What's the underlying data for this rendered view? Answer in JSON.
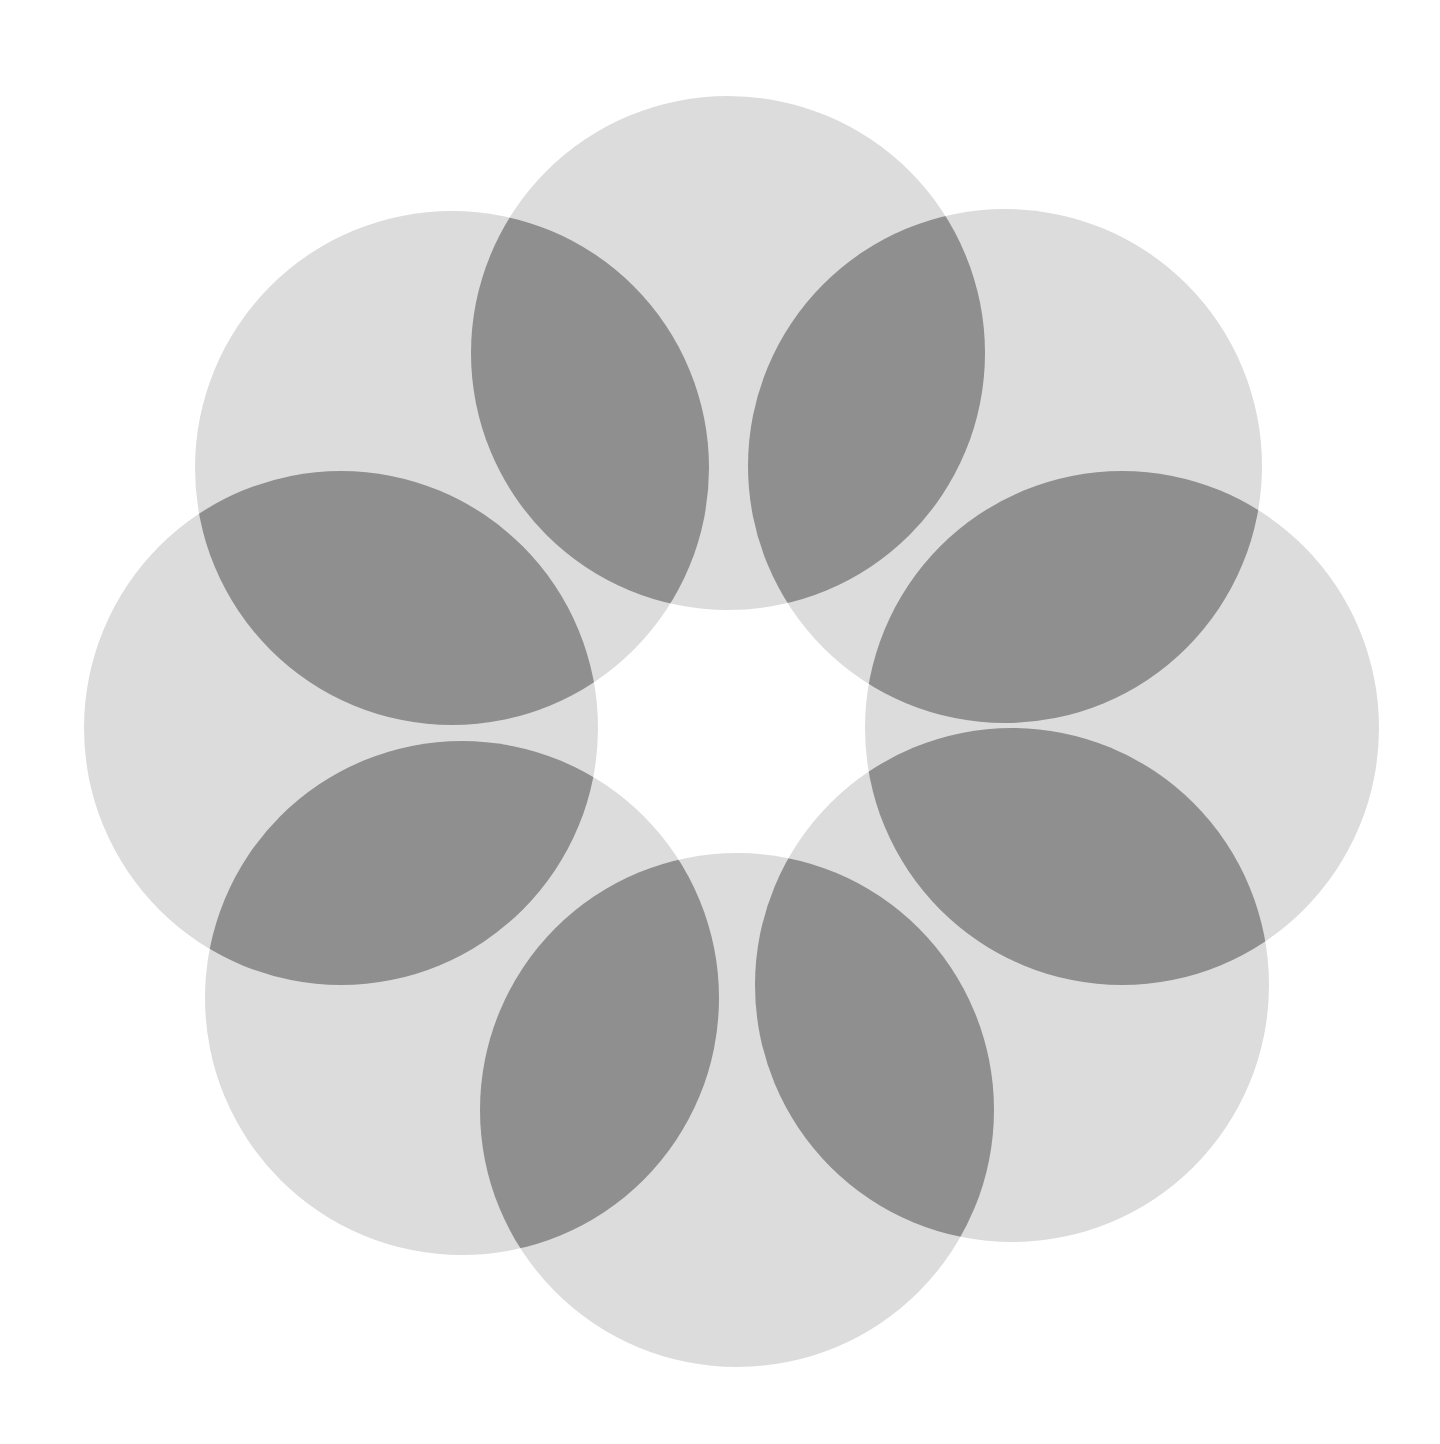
{
  "figure": {
    "width": 1440,
    "height": 1444,
    "background": "#ffffff",
    "light_color": "#dcdcdc",
    "overlap_color": "#8f8f8f",
    "radius": 257,
    "circles": [
      {
        "name": "circle-top",
        "cx": 728,
        "cy": 353
      },
      {
        "name": "circle-top-right",
        "cx": 1005,
        "cy": 466
      },
      {
        "name": "circle-right",
        "cx": 1122,
        "cy": 728
      },
      {
        "name": "circle-bottom-right",
        "cx": 1012,
        "cy": 985
      },
      {
        "name": "circle-bottom",
        "cx": 737,
        "cy": 1110
      },
      {
        "name": "circle-bottom-left",
        "cx": 462,
        "cy": 998
      },
      {
        "name": "circle-left",
        "cx": 341,
        "cy": 728
      },
      {
        "name": "circle-top-left",
        "cx": 452,
        "cy": 468
      }
    ]
  }
}
